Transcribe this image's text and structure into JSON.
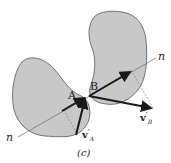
{
  "figure": {
    "caption": "(c)",
    "labels": {
      "point_a": "A",
      "point_b": "B",
      "normal_top": "n",
      "normal_bottom": "n",
      "va_prime": "v",
      "va_sup": "′",
      "va_sub": "A",
      "vb_prime": "v",
      "vb_sup": "′",
      "vb_sub": "B"
    },
    "colors": {
      "body_fill": "#c8c8c8",
      "body_stroke": "#555555",
      "arrow": "#1a1a1a",
      "line": "#666666"
    }
  }
}
